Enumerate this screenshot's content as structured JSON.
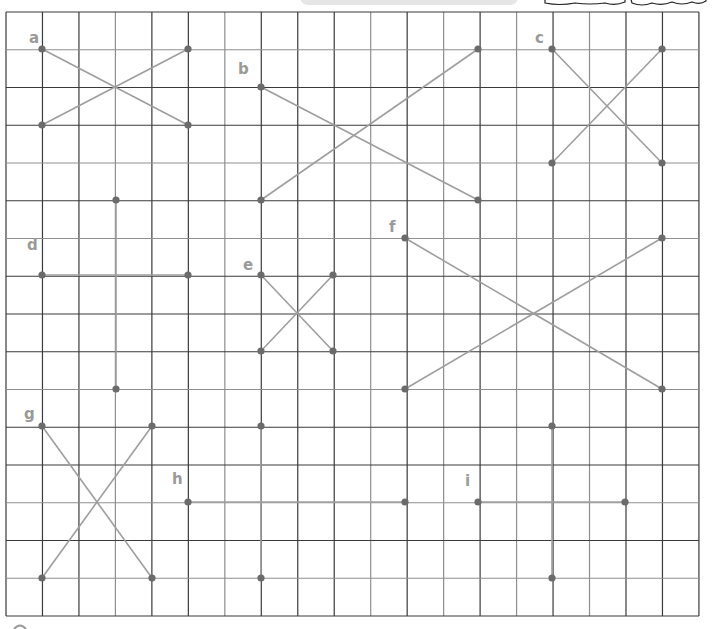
{
  "worksheet": {
    "title": "Grid line-segment exercise",
    "grid": {
      "x0": 6,
      "y0": 12,
      "columns": 19,
      "rows": 16,
      "cell_w": 36.47,
      "cell_h": 37.75,
      "dark_color": "#3a3a3a",
      "light_color": "#8f8f8f",
      "light_columns": [
        3,
        6,
        10,
        12,
        14,
        16
      ],
      "light_rows": [
        1,
        4,
        6,
        10,
        13,
        15
      ]
    },
    "colors": {
      "segment": "#9e9e9e",
      "dot": "#6b6b6b",
      "label": "#9a9a9a",
      "top_bar": "#e6e6e6",
      "top_blob_stroke": "#222222"
    },
    "figures": [
      {
        "id": "a",
        "label": "a",
        "label_pos": [
          29,
          43
        ],
        "segments": [
          [
            [
              42,
              49
            ],
            [
              188,
              125
            ]
          ],
          [
            [
              42,
              125
            ],
            [
              188,
              49
            ]
          ]
        ]
      },
      {
        "id": "b",
        "label": "b",
        "label_pos": [
          238,
          74
        ],
        "segments": [
          [
            [
              261,
              87
            ],
            [
              478,
              200
            ]
          ],
          [
            [
              261,
              200
            ],
            [
              478,
              49
            ]
          ]
        ]
      },
      {
        "id": "c",
        "label": "c",
        "label_pos": [
          535,
          43
        ],
        "segments": [
          [
            [
              552,
              49
            ],
            [
              662,
              163
            ]
          ],
          [
            [
              552,
              163
            ],
            [
              662,
              49
            ]
          ]
        ]
      },
      {
        "id": "d",
        "label": "d",
        "label_pos": [
          27,
          250
        ],
        "segments": [
          [
            [
              42,
              275
            ],
            [
              188,
              275
            ]
          ]
        ]
      },
      {
        "id": "e",
        "label": "e",
        "label_pos": [
          243,
          270
        ],
        "segments": [
          [
            [
              261,
              275
            ],
            [
              333,
              351
            ]
          ],
          [
            [
              261,
              351
            ],
            [
              333,
              275
            ]
          ]
        ]
      },
      {
        "id": "f",
        "label": "f",
        "label_pos": [
          389,
          232
        ],
        "segments": [
          [
            [
              405,
              238
            ],
            [
              662,
              389
            ]
          ],
          [
            [
              405,
              389
            ],
            [
              662,
              238
            ]
          ]
        ]
      },
      {
        "id": "g",
        "label": "g",
        "label_pos": [
          24,
          419
        ],
        "segments": [
          [
            [
              42,
              426
            ],
            [
              152,
              578
            ]
          ],
          [
            [
              42,
              578
            ],
            [
              152,
              426
            ]
          ]
        ]
      },
      {
        "id": "h",
        "label": "h",
        "label_pos": [
          172,
          484
        ],
        "segments": [
          [
            [
              188,
              502
            ],
            [
              405,
              502
            ]
          ]
        ]
      },
      {
        "id": "i",
        "label": "i",
        "label_pos": [
          465,
          486
        ],
        "segments": [
          [
            [
              478,
              502
            ],
            [
              625,
              502
            ]
          ]
        ]
      },
      {
        "id": "v1",
        "label": "",
        "label_pos": null,
        "segments": [
          [
            [
              116,
              200
            ],
            [
              116,
              389
            ]
          ]
        ]
      },
      {
        "id": "v2",
        "label": "",
        "label_pos": null,
        "segments": [
          [
            [
              261,
              426
            ],
            [
              261,
              578
            ]
          ]
        ]
      },
      {
        "id": "v3",
        "label": "",
        "label_pos": null,
        "segments": [
          [
            [
              552,
              426
            ],
            [
              552,
              578
            ]
          ]
        ]
      }
    ]
  }
}
